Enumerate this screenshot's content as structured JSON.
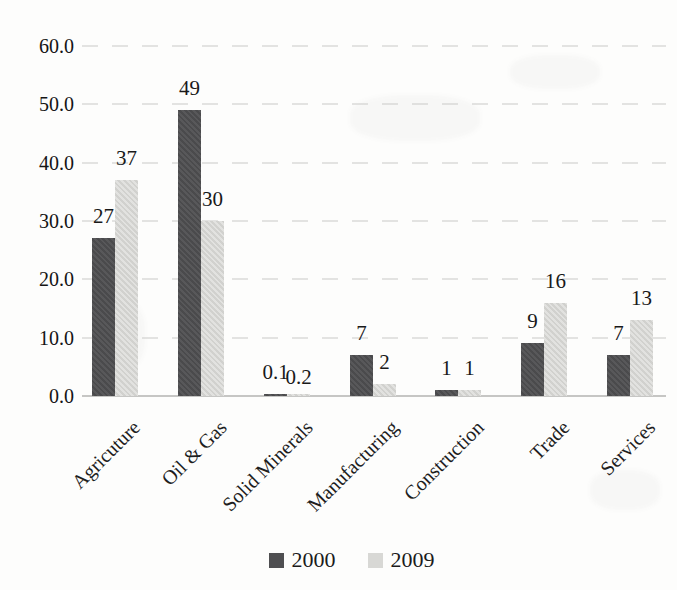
{
  "meta": {
    "clipped_title_fragment": "in Current Prices"
  },
  "chart_data": {
    "type": "bar",
    "title": "",
    "xlabel": "",
    "ylabel": "",
    "categories": [
      "Agricuture",
      "Oil & Gas",
      "Solid Minerals",
      "Manufacturing",
      "Construction",
      "Trade",
      "Services"
    ],
    "series": [
      {
        "name": "2000",
        "color": "#4f4f51",
        "values": [
          27,
          49,
          0.1,
          7,
          1,
          9,
          7
        ],
        "labels": [
          "27",
          "49",
          "0.1",
          "7",
          "1",
          "9",
          "7"
        ]
      },
      {
        "name": "2009",
        "color": "#d8d8d5",
        "values": [
          37,
          30,
          0.2,
          2,
          1,
          16,
          13
        ],
        "labels": [
          "37",
          "30",
          "0.2",
          "2",
          "1",
          "16",
          "13"
        ]
      }
    ],
    "ylim": [
      0,
      60
    ],
    "yticks": [
      "60.0",
      "50.0",
      "40.0",
      "30.0",
      "20.0",
      "10.0",
      "0.0"
    ],
    "ytick_values": [
      60,
      50,
      40,
      30,
      20,
      10,
      0
    ],
    "grid": true,
    "legend_position": "bottom-center"
  }
}
